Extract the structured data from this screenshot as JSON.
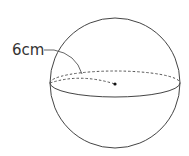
{
  "figure": {
    "type": "sphere",
    "radius_label": "6cm",
    "stroke_color": "#444444",
    "background": "#ffffff"
  }
}
